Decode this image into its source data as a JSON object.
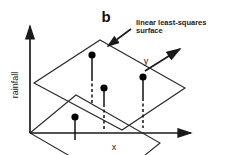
{
  "figure": {
    "title_label": "b",
    "annotation": {
      "line1": "linear least-squares",
      "line2": "surface"
    },
    "axes": {
      "vertical_label": "rainfall",
      "horizontal_label": "x",
      "depth_label": "y"
    },
    "colors": {
      "ink": "#1a1a1a",
      "line": "#222222",
      "background": "#ffffff",
      "point_fill": "#000000"
    },
    "geometry": {
      "origin": [
        30,
        133
      ],
      "vertical_axis_tip": [
        30,
        22
      ],
      "horizontal_axis_tip": [
        196,
        133
      ],
      "depth_axis_tip": [
        183,
        46
      ],
      "plane_vertices": [
        [
          100,
          40
        ],
        [
          185,
          88
        ],
        [
          122,
          130
        ],
        [
          34,
          83
        ]
      ],
      "base_plane_vertices": [
        [
          30,
          133
        ],
        [
          76,
          95
        ],
        [
          160,
          143
        ],
        [
          113,
          180
        ]
      ],
      "data_points": [
        {
          "id": "p1",
          "point": [
            92,
            55
          ],
          "base": [
            92,
            103
          ],
          "dash_from": [
            92,
            78
          ]
        },
        {
          "id": "p2",
          "point": [
            104,
            88
          ],
          "base": [
            104,
            131
          ],
          "dash_from": [
            104,
            104
          ]
        },
        {
          "id": "p3",
          "point": [
            143,
            77
          ],
          "base": [
            143,
            127
          ],
          "dash_from": [
            143,
            98
          ]
        },
        {
          "id": "p4",
          "point": [
            75,
            117
          ],
          "base": [
            75,
            140
          ],
          "dash_from": null
        }
      ],
      "callout_arrow": {
        "from": [
          131,
          31
        ],
        "to": [
          106,
          48
        ]
      }
    }
  }
}
